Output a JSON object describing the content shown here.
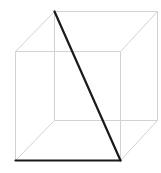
{
  "diagram": {
    "type": "wireframe-cube",
    "colors": {
      "background": "#ffffff",
      "edge": "#d2d2d2",
      "highlight": "#1a1a1a"
    },
    "vertices": {
      "front_top_left": [
        15,
        51
      ],
      "front_top_right": [
        120,
        51
      ],
      "front_bottom_left": [
        15,
        160
      ],
      "front_bottom_right": [
        120,
        160
      ],
      "back_top_left": [
        54,
        11
      ],
      "back_top_right": [
        157,
        11
      ],
      "back_bottom_left": [
        54,
        120
      ],
      "back_bottom_right": [
        157,
        120
      ]
    },
    "edges": [
      [
        "front_top_left",
        "front_top_right"
      ],
      [
        "front_top_right",
        "front_bottom_right"
      ],
      [
        "front_top_left",
        "front_bottom_left"
      ],
      [
        "back_top_left",
        "back_top_right"
      ],
      [
        "back_top_right",
        "back_bottom_right"
      ],
      [
        "back_bottom_left",
        "back_bottom_right"
      ],
      [
        "back_top_left",
        "back_bottom_left"
      ],
      [
        "front_top_left",
        "back_top_left"
      ],
      [
        "front_top_right",
        "back_top_right"
      ],
      [
        "front_bottom_left",
        "back_bottom_left"
      ],
      [
        "front_bottom_right",
        "back_bottom_right"
      ]
    ],
    "highlighted_segments": [
      {
        "name": "space-diagonal",
        "from": "back_top_left",
        "to": "front_bottom_right"
      },
      {
        "name": "front-bottom-edge",
        "from": "front_bottom_left",
        "to": "front_bottom_right"
      }
    ]
  }
}
